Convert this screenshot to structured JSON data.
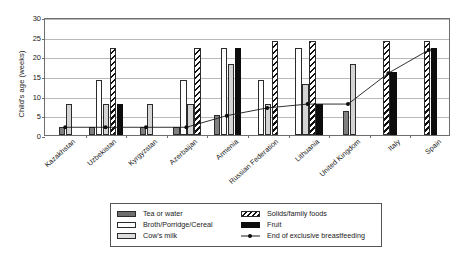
{
  "chart_data": {
    "type": "bar",
    "title": "",
    "xlabel": "",
    "ylabel": "Child's age (weeks)",
    "ylim": [
      0,
      30
    ],
    "yticks": [
      0,
      5,
      10,
      15,
      20,
      25,
      30
    ],
    "grid": true,
    "legend_position": "bottom",
    "categories": [
      "Kazakhstan",
      "Uzbekistan",
      "Kyrgyzstan",
      "Azerbaijan",
      "Armenia",
      "Russian Federation",
      "Lithuania",
      "United Kingdom",
      "Italy",
      "Spain"
    ],
    "series": [
      {
        "name": "Tea or water",
        "key": "tea",
        "style": "s-tea",
        "values": [
          2,
          2,
          2,
          2,
          5,
          null,
          null,
          6,
          null,
          null
        ]
      },
      {
        "name": "Broth/Porridge/Cereal",
        "key": "broth",
        "style": "s-broth",
        "values": [
          null,
          14,
          null,
          14,
          22,
          14,
          22,
          null,
          null,
          null
        ]
      },
      {
        "name": "Cow's milk",
        "key": "milk",
        "style": "s-milk",
        "values": [
          8,
          8,
          8,
          8,
          18,
          8,
          13,
          18,
          null,
          null
        ]
      },
      {
        "name": "Solids/family foods",
        "key": "solids",
        "style": "s-solid",
        "values": [
          null,
          22,
          null,
          22,
          null,
          24,
          24,
          null,
          24,
          24
        ]
      },
      {
        "name": "Fruit",
        "key": "fruit",
        "style": "s-fruit",
        "values": [
          null,
          8,
          null,
          null,
          22,
          null,
          8,
          null,
          16,
          22
        ]
      }
    ],
    "line_series": {
      "name": "End of exclusive breastfeeding",
      "values": [
        2,
        2,
        2,
        2,
        5,
        7,
        8,
        8,
        16,
        22
      ]
    }
  },
  "legend": {
    "items": [
      {
        "label": "Tea or water",
        "swatch": "sw-tea"
      },
      {
        "label": "Solids/family foods",
        "swatch": "sw-solid"
      },
      {
        "label": "Broth/Porridge/Cereal",
        "swatch": "sw-broth"
      },
      {
        "label": "Fruit",
        "swatch": "sw-fruit"
      },
      {
        "label": "Cow's milk",
        "swatch": "sw-milk"
      },
      {
        "label": "End of exclusive breastfeeding",
        "swatch": "sw-line"
      }
    ]
  }
}
